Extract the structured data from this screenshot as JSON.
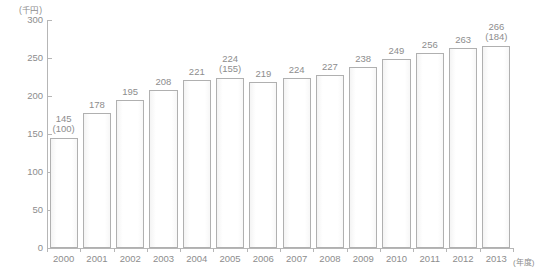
{
  "chart_data": {
    "type": "bar",
    "title": "",
    "subtitle": "",
    "xlabel": "(年度)",
    "ylabel": "(千円)",
    "ylim": [
      0,
      300
    ],
    "ytick_labels": [
      "300",
      "250",
      "200",
      "150",
      "100",
      "50",
      "0"
    ],
    "ytick_values": [
      300,
      250,
      200,
      150,
      100,
      50,
      0
    ],
    "grid": false,
    "legend": "none",
    "categories": [
      "2000",
      "2001",
      "2002",
      "2003",
      "2004",
      "2005",
      "2006",
      "2007",
      "2008",
      "2009",
      "2010",
      "2011",
      "2012",
      "2013"
    ],
    "values": [
      145,
      178,
      195,
      208,
      221,
      224,
      219,
      224,
      227,
      238,
      249,
      256,
      263,
      266
    ],
    "value_labels": [
      "145",
      "178",
      "195",
      "208",
      "221",
      "224",
      "219",
      "224",
      "227",
      "238",
      "249",
      "256",
      "263",
      "266"
    ],
    "index_labels": [
      "(100)",
      "",
      "",
      "",
      "",
      "(155)",
      "",
      "",
      "",
      "",
      "",
      "",
      "",
      "(184)"
    ],
    "bar_fill": "#ffffff",
    "bar_border": "#b0b0b0",
    "axis_color": "#b6b6b6",
    "text_color": "#8d8d8d"
  }
}
